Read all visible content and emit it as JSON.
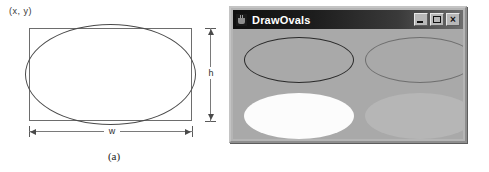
{
  "figure": {
    "panel_a": {
      "caption": "(a)",
      "origin_label": "(x, y)",
      "height_label": "h",
      "width_label": "w",
      "shape": "ellipse-inscribed-in-bounding-rectangle",
      "colors": {
        "rect_stroke": "#6d6d6d",
        "ellipse_stroke": "#4a4a4a",
        "dimension_line": "#7a7a7a",
        "background": "#ffffff"
      }
    },
    "panel_b": {
      "caption": "(b)",
      "window": {
        "title": "DrawOvals",
        "app_icon": "java-cup-icon",
        "buttons": [
          {
            "name": "minimize",
            "label": "_"
          },
          {
            "name": "maximize",
            "label": "□"
          },
          {
            "name": "close",
            "label": "×"
          }
        ],
        "canvas": {
          "background": "#a9a9a9",
          "ovals": [
            {
              "name": "oval-top-left",
              "style": "draw",
              "stroke": "#2a2a2a"
            },
            {
              "name": "oval-top-right",
              "style": "draw",
              "stroke": "#6f6f6f"
            },
            {
              "name": "oval-bottom-left",
              "style": "fill",
              "fill": "#fcfcfc"
            },
            {
              "name": "oval-bottom-right",
              "style": "fill",
              "fill": "#b6b6b6"
            }
          ]
        }
      }
    }
  }
}
